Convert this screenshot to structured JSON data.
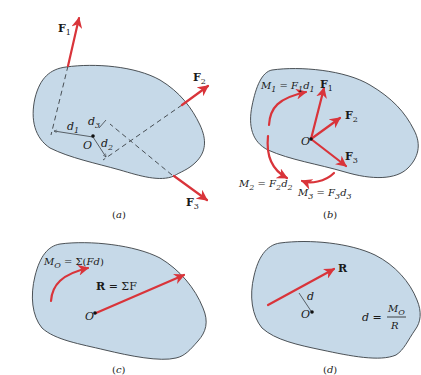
{
  "panels": {
    "a": {
      "caption": "(a)",
      "point": "O",
      "forces": [
        {
          "name": "F",
          "sub": "1"
        },
        {
          "name": "F",
          "sub": "2"
        },
        {
          "name": "F",
          "sub": "3"
        }
      ],
      "distances": [
        {
          "name": "d",
          "sub": "1"
        },
        {
          "name": "d",
          "sub": "2"
        },
        {
          "name": "d",
          "sub": "3"
        }
      ]
    },
    "b": {
      "caption": "(b)",
      "point": "O",
      "forces": [
        {
          "name": "F",
          "sub": "1"
        },
        {
          "name": "F",
          "sub": "2"
        },
        {
          "name": "F",
          "sub": "3"
        }
      ],
      "moments": [
        {
          "lhs": "M",
          "lhs_sub": "1",
          "eq": " = ",
          "f": "F",
          "f_sub": "1",
          "d": "d",
          "d_sub": "1"
        },
        {
          "lhs": "M",
          "lhs_sub": "2",
          "eq": " = ",
          "f": "F",
          "f_sub": "2",
          "d": "d",
          "d_sub": "2"
        },
        {
          "lhs": "M",
          "lhs_sub": "3",
          "eq": " = ",
          "f": "F",
          "f_sub": "3",
          "d": "d",
          "d_sub": "3"
        }
      ]
    },
    "c": {
      "caption": "(c)",
      "point": "O",
      "moment": {
        "lhs": "M",
        "lhs_sub": "O",
        "rhs": " = Σ(",
        "fd": "Fd",
        "close": ")"
      },
      "resultant": {
        "lhs": "R",
        "rhs": " = ΣF"
      }
    },
    "d": {
      "caption": "(d)",
      "point": "O",
      "resultant": "R",
      "distance": "d",
      "formula": {
        "lhs": "d",
        "eq": " = ",
        "num": "M",
        "num_sub": "O",
        "den": "R"
      }
    }
  },
  "colors": {
    "body_fill": "#c6d9e8",
    "outline": "#3a3f44",
    "force": "#d9343a"
  }
}
